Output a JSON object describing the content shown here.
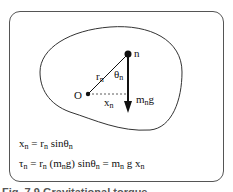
{
  "diagram": {
    "labels": {
      "point_n": "n",
      "origin": "O",
      "r": "r",
      "r_sub": "n",
      "theta": "θ",
      "theta_sub": "n",
      "x": "x",
      "x_sub": "n",
      "force_m": "m",
      "force_sub": "n",
      "force_g": "g"
    },
    "colors": {
      "stroke": "#111111",
      "frame": "#555555"
    }
  },
  "equations": {
    "eq1": {
      "lhs": "x",
      "lhs_sub": "n",
      "eq": " = r",
      "r_sub": "n",
      "sin": " sinθ",
      "sin_sub": "n"
    },
    "eq2": {
      "lhs": "τ",
      "lhs_sub": "n",
      "p1": " = r",
      "p1_sub": "n",
      "p2": " (m",
      "p2_sub": "n",
      "p3": "g) sinθ",
      "p3_sub": "n",
      "p4": " = m",
      "p4_sub": "n",
      "p5": " g x",
      "p5_sub": "n"
    }
  },
  "caption": "Fig. 7.9  Gravitational torque"
}
